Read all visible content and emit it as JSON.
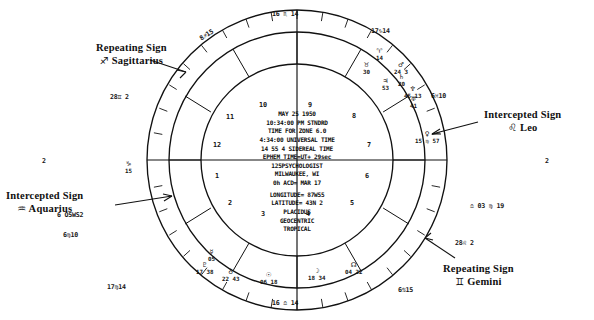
{
  "chart": {
    "type": "natal-wheel",
    "center_data": {
      "date": "MAY 25 1950",
      "time_local": "10:34:00 PM STNDRD",
      "zone": "TIME FOR ZONE  6.0",
      "time_universal": "4:34:00 UNIVERSAL TIME",
      "sidereal": "14 55  4 SIDEREAL TIME",
      "ephem": "EPHEM TIME=UT+        29sec",
      "occupation": "125PSYCHOLOGIST",
      "city": "MILWAUKEE, WI",
      "acd": "0h ACD= MAR 17",
      "longitude": "LONGITUDE= 87W55",
      "latitude": "LATITUDE=  43N 2",
      "house_system": "PLACIDUS",
      "frame": "GEOCENTRIC",
      "zodiac": "TROPICAL"
    },
    "annotations": [
      {
        "id": "sagittarius",
        "line1": "Repeating Sign",
        "glyph": "♐",
        "sign": "Sagittarius"
      },
      {
        "id": "aquarius",
        "line1": "Intercepted Sign",
        "glyph": "♒",
        "sign": "Aquarius"
      },
      {
        "id": "leo",
        "line1": "Intercepted Sign",
        "glyph": "♌",
        "sign": "Leo"
      },
      {
        "id": "gemini",
        "line1": "Repeating Sign",
        "glyph": "♊",
        "sign": "Gemini"
      }
    ],
    "cusps": [
      {
        "house": 10,
        "label": "16 ♏ 14",
        "deg": "16",
        "glyph": "♏",
        "min": "14"
      },
      {
        "house": 11,
        "label": "17♑ 14",
        "deg": "17",
        "glyph": "♑",
        "min": "14"
      },
      {
        "house": 12,
        "label": "6♓ 10",
        "deg": "6",
        "glyph": "♓",
        "min": "10"
      },
      {
        "house": 1,
        "label": "2 ♈ 6",
        "deg": "2",
        "glyph": "♈",
        "min": "6"
      },
      {
        "house": 2,
        "label": "28♊ 2",
        "deg": "28",
        "glyph": "♊",
        "min": "2"
      },
      {
        "house": 3,
        "label": "6♋ 15",
        "deg": "6",
        "glyph": "♋",
        "min": "15"
      },
      {
        "house": 4,
        "label": "16 ♎ 14",
        "deg": "16",
        "glyph": "♎",
        "min": "14"
      },
      {
        "house": 5,
        "label": "17♍ 14",
        "deg": "17",
        "glyph": "♍",
        "min": "14"
      },
      {
        "house": 6,
        "label": "6♌ 10",
        "deg": "6",
        "glyph": "♌",
        "min": "10"
      },
      {
        "house": 7,
        "label": "2 ♎ 6",
        "deg": "2",
        "glyph": "♎",
        "min": "6"
      },
      {
        "house": 8,
        "label": "28♐ 2",
        "deg": "28",
        "glyph": "♐",
        "min": "2"
      },
      {
        "house": 9,
        "label": "8♐ 15",
        "deg": "8",
        "glyph": "♐",
        "min": "15"
      }
    ],
    "rim_labels": [
      {
        "id": "top",
        "text": "16 ♏ 14",
        "x": 272,
        "y": 10,
        "rot": 0
      },
      {
        "id": "upper-left",
        "text": "8♐15",
        "x": 199,
        "y": 31,
        "rot": -32
      },
      {
        "id": "upper-right",
        "text": "17♑14",
        "x": 371,
        "y": 27,
        "rot": 0
      },
      {
        "id": "left-upper",
        "text": "28♊ 2",
        "x": 110,
        "y": 93,
        "rot": 0
      },
      {
        "id": "right-upper",
        "text": "6♓10",
        "x": 431,
        "y": 92,
        "rot": 0
      },
      {
        "id": "left-mid",
        "text": "2",
        "x": 42,
        "y": 157,
        "rot": 0
      },
      {
        "id": "right-mid",
        "text": "2",
        "x": 545,
        "y": 157,
        "rot": 0
      },
      {
        "id": "left-lower",
        "text": "6 O5WS2",
        "x": 57,
        "y": 211,
        "rot": 0
      },
      {
        "id": "right-lower",
        "text": "♎ 03 ♍ 19",
        "x": 470,
        "y": 202,
        "rot": 0
      },
      {
        "id": "lower-left",
        "text": "6♍10",
        "x": 63,
        "y": 231,
        "rot": 0
      },
      {
        "id": "lower-right",
        "text": "28♌ 2",
        "x": 455,
        "y": 239,
        "rot": 0
      },
      {
        "id": "bottom-left",
        "text": "17♍14",
        "x": 107,
        "y": 283,
        "rot": 0
      },
      {
        "id": "bottom-right",
        "text": "6♋15",
        "x": 398,
        "y": 286,
        "rot": 0
      },
      {
        "id": "bottom",
        "text": "16 ♎ 14",
        "x": 272,
        "y": 299,
        "rot": 0
      }
    ],
    "house_numbers": [
      {
        "n": "10",
        "x": 259,
        "y": 101
      },
      {
        "n": "9",
        "x": 308,
        "y": 101
      },
      {
        "n": "11",
        "x": 226,
        "y": 113
      },
      {
        "n": "8",
        "x": 352,
        "y": 112
      },
      {
        "n": "12",
        "x": 213,
        "y": 141
      },
      {
        "n": "7",
        "x": 367,
        "y": 141
      },
      {
        "n": "1",
        "x": 215,
        "y": 172
      },
      {
        "n": "6",
        "x": 365,
        "y": 172
      },
      {
        "n": "2",
        "x": 228,
        "y": 199
      },
      {
        "n": "5",
        "x": 350,
        "y": 199
      },
      {
        "n": "3",
        "x": 261,
        "y": 210
      },
      {
        "n": "4",
        "x": 306,
        "y": 210
      }
    ],
    "planets": [
      {
        "id": "p1",
        "glyph": "♈",
        "deg": "14",
        "rx": 376,
        "ry": 48
      },
      {
        "id": "p2",
        "glyph": "♉",
        "deg": "30",
        "rx": 363,
        "ry": 62
      },
      {
        "id": "p3",
        "glyph": "♂",
        "deg": "24  3",
        "rx": 394,
        "ry": 62
      },
      {
        "id": "p4",
        "glyph": "♄",
        "deg": "20",
        "rx": 398,
        "ry": 74
      },
      {
        "id": "p5",
        "glyph": "♃",
        "deg": "53",
        "rx": 382,
        "ry": 78
      },
      {
        "id": "p6",
        "glyph": "♆",
        "deg": "45 13",
        "rx": 404,
        "ry": 86
      },
      {
        "id": "p7",
        "glyph": "♅",
        "deg": "41",
        "rx": 410,
        "ry": 96
      },
      {
        "id": "p8",
        "glyph": "♀",
        "deg": "15 ♍ 57",
        "rx": 415,
        "ry": 131
      },
      {
        "id": "p9",
        "glyph": "☿",
        "deg": "05",
        "rx": 208,
        "ry": 249
      },
      {
        "id": "p10",
        "glyph": "♇",
        "deg": "17 38",
        "rx": 196,
        "ry": 262
      },
      {
        "id": "p11",
        "glyph": "♁",
        "deg": "22 43",
        "rx": 222,
        "ry": 269
      },
      {
        "id": "p12",
        "glyph": "☉",
        "deg": "06 18",
        "rx": 260,
        "ry": 272
      },
      {
        "id": "p13",
        "glyph": "☽",
        "deg": "18 34",
        "rx": 308,
        "ry": 268
      },
      {
        "id": "p14",
        "glyph": "☊",
        "deg": "04 22",
        "rx": 345,
        "ry": 262
      },
      {
        "id": "p15",
        "glyph": "♑",
        "deg": "15",
        "rx": 125,
        "ry": 161
      }
    ],
    "wheel": {
      "cx": 297,
      "cy": 160,
      "r_outer": 150,
      "r_sign": 128,
      "r_house": 96,
      "stroke": "#111111"
    }
  }
}
